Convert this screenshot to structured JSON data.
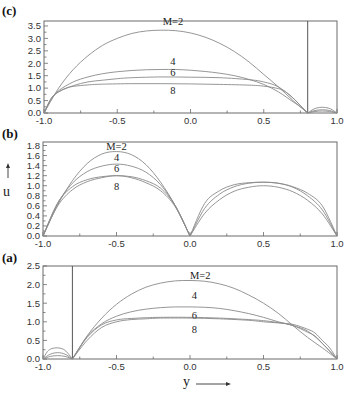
{
  "chart_data": [
    {
      "panel": "(c)",
      "type": "line",
      "xlim": [
        -1.0,
        1.0
      ],
      "ylim": [
        0,
        3.7
      ],
      "xticks": [
        -1.0,
        -0.5,
        0.0,
        0.5,
        1.0
      ],
      "xtick_labels": [
        "-1.0",
        "-0.5",
        "0.0",
        "0.5",
        "1.0"
      ],
      "yticks": [
        0.0,
        0.5,
        1.0,
        1.5,
        2.0,
        2.5,
        3.0,
        3.5
      ],
      "ytick_labels": [
        "0.0",
        "0.5",
        "1.0",
        "1.5",
        "2.0",
        "2.5",
        "3.0",
        "3.5"
      ],
      "vertical_line_at": 0.8,
      "frame": {
        "x0": 44,
        "x1": 337,
        "y0": 21,
        "y1": 113
      },
      "series": [
        {
          "name": "M=2",
          "label": "M=2",
          "label_pos": [
            -0.12,
            3.55
          ],
          "x": [
            -1.0,
            -0.9,
            -0.8,
            -0.7,
            -0.6,
            -0.5,
            -0.4,
            -0.3,
            -0.2,
            -0.1,
            0.0,
            0.1,
            0.2,
            0.3,
            0.4,
            0.5,
            0.6,
            0.7,
            0.8
          ],
          "y": [
            0.0,
            1.0,
            1.75,
            2.3,
            2.72,
            3.0,
            3.2,
            3.3,
            3.33,
            3.31,
            3.22,
            3.05,
            2.8,
            2.47,
            2.05,
            1.55,
            1.05,
            0.5,
            0.0
          ]
        },
        {
          "name": "M=4",
          "label": "4",
          "label_pos": [
            -0.12,
            1.95
          ],
          "x": [
            -1.0,
            -0.95,
            -0.9,
            -0.8,
            -0.7,
            -0.6,
            -0.5,
            -0.4,
            -0.3,
            -0.2,
            -0.1,
            0.0,
            0.1,
            0.2,
            0.3,
            0.4,
            0.5,
            0.6,
            0.7,
            0.75,
            0.8
          ],
          "y": [
            0.0,
            0.55,
            0.9,
            1.25,
            1.45,
            1.58,
            1.66,
            1.71,
            1.74,
            1.75,
            1.75,
            1.72,
            1.67,
            1.6,
            1.5,
            1.35,
            1.15,
            0.85,
            0.45,
            0.25,
            0.0
          ]
        },
        {
          "name": "M=6",
          "label": "6",
          "label_pos": [
            -0.12,
            1.5
          ],
          "x": [
            -1.0,
            -0.95,
            -0.9,
            -0.8,
            -0.7,
            -0.6,
            -0.5,
            -0.4,
            -0.2,
            0.0,
            0.2,
            0.4,
            0.5,
            0.6,
            0.7,
            0.75,
            0.8
          ],
          "y": [
            0.0,
            0.58,
            0.85,
            1.1,
            1.25,
            1.32,
            1.38,
            1.42,
            1.45,
            1.44,
            1.42,
            1.34,
            1.25,
            1.05,
            0.6,
            0.3,
            0.0
          ]
        },
        {
          "name": "M=8",
          "label": "8",
          "label_pos": [
            -0.12,
            0.75
          ],
          "x": [
            -1.0,
            -0.95,
            -0.9,
            -0.85,
            -0.8,
            -0.7,
            -0.6,
            -0.4,
            -0.2,
            0.0,
            0.2,
            0.4,
            0.5,
            0.6,
            0.65,
            0.7,
            0.75,
            0.8
          ],
          "y": [
            0.0,
            0.6,
            0.85,
            1.0,
            1.07,
            1.13,
            1.16,
            1.18,
            1.18,
            1.17,
            1.15,
            1.12,
            1.08,
            0.98,
            0.85,
            0.6,
            0.3,
            0.0
          ]
        },
        {
          "name": "M=2 (right)",
          "label": "",
          "x": [
            0.8,
            0.83,
            0.86,
            0.9,
            0.94,
            0.97,
            1.0
          ],
          "y": [
            0.0,
            0.12,
            0.2,
            0.23,
            0.2,
            0.12,
            0.0
          ]
        },
        {
          "name": "M=4 (right)",
          "label": "",
          "x": [
            0.8,
            0.85,
            0.9,
            0.95,
            1.0
          ],
          "y": [
            0.0,
            0.1,
            0.13,
            0.1,
            0.0
          ]
        },
        {
          "name": "M=6 (right)",
          "label": "",
          "x": [
            0.8,
            0.85,
            0.9,
            0.95,
            1.0
          ],
          "y": [
            0.0,
            0.06,
            0.08,
            0.06,
            0.0
          ]
        }
      ]
    },
    {
      "panel": "(b)",
      "type": "line",
      "xlim": [
        -1.0,
        1.0
      ],
      "ylim": [
        0,
        1.87
      ],
      "xticks": [
        -1.0,
        -0.5,
        0.0,
        0.5,
        1.0
      ],
      "xtick_labels": [
        "-1.0",
        "-0.5",
        "0.0",
        "0.5",
        "1.0"
      ],
      "yticks": [
        0.0,
        0.2,
        0.4,
        0.6,
        0.8,
        1.0,
        1.2,
        1.4,
        1.6,
        1.8
      ],
      "ytick_labels": [
        "0.0",
        "0.2",
        "0.4",
        "0.6",
        "0.8",
        "1.0",
        "1.2",
        "1.4",
        "1.6",
        "1.8"
      ],
      "ylabel": "u",
      "frame": {
        "x0": 43,
        "x1": 337,
        "y0": 142,
        "y1": 236
      },
      "series": [
        {
          "name": "M=2",
          "label": "M=2",
          "label_pos": [
            -0.5,
            1.72
          ],
          "x": [
            -1.0,
            -0.9,
            -0.8,
            -0.7,
            -0.6,
            -0.5,
            -0.4,
            -0.3,
            -0.2,
            -0.1,
            0.0
          ],
          "y": [
            0.0,
            0.62,
            1.1,
            1.44,
            1.63,
            1.68,
            1.62,
            1.42,
            1.07,
            0.6,
            0.0
          ]
        },
        {
          "name": "M=4",
          "label": "4",
          "label_pos": [
            -0.5,
            1.5
          ],
          "x": [
            -1.0,
            -0.9,
            -0.8,
            -0.7,
            -0.6,
            -0.5,
            -0.4,
            -0.3,
            -0.2,
            -0.1,
            0.0
          ],
          "y": [
            0.0,
            0.65,
            1.05,
            1.28,
            1.39,
            1.43,
            1.39,
            1.27,
            1.02,
            0.6,
            0.0
          ]
        },
        {
          "name": "M=6",
          "label": "6",
          "label_pos": [
            -0.5,
            1.28
          ],
          "x": [
            -1.0,
            -0.9,
            -0.8,
            -0.7,
            -0.6,
            -0.5,
            -0.4,
            -0.3,
            -0.2,
            -0.1,
            0.0
          ],
          "y": [
            0.0,
            0.66,
            0.98,
            1.12,
            1.18,
            1.2,
            1.18,
            1.1,
            0.95,
            0.6,
            0.0
          ]
        },
        {
          "name": "M=8",
          "label": "8",
          "label_pos": [
            -0.5,
            0.92
          ],
          "x": [
            -1.0,
            -0.9,
            -0.8,
            -0.7,
            -0.6,
            -0.5,
            -0.4,
            -0.3,
            -0.2,
            -0.1,
            0.0
          ],
          "y": [
            0.0,
            0.6,
            0.92,
            1.08,
            1.16,
            1.2,
            1.16,
            1.06,
            0.9,
            0.58,
            0.0
          ]
        },
        {
          "name": "M=2 (right)",
          "label": "",
          "x": [
            0.0,
            0.1,
            0.2,
            0.3,
            0.4,
            0.5,
            0.6,
            0.7,
            0.8,
            0.9,
            1.0
          ],
          "y": [
            0.0,
            0.65,
            0.9,
            1.02,
            1.06,
            1.07,
            1.05,
            0.98,
            0.85,
            0.6,
            0.0
          ]
        },
        {
          "name": "M=4 (right)",
          "label": "",
          "x": [
            0.0,
            0.1,
            0.2,
            0.3,
            0.4,
            0.5,
            0.6,
            0.7,
            0.8,
            0.9,
            1.0
          ],
          "y": [
            0.0,
            0.55,
            0.83,
            0.98,
            1.05,
            1.07,
            1.05,
            0.97,
            0.8,
            0.52,
            0.0
          ]
        },
        {
          "name": "M=8 (right)",
          "label": "",
          "x": [
            0.0,
            0.1,
            0.2,
            0.3,
            0.4,
            0.5,
            0.6,
            0.7,
            0.8,
            0.9,
            1.0
          ],
          "y": [
            0.0,
            0.45,
            0.72,
            0.89,
            0.97,
            1.0,
            0.97,
            0.88,
            0.71,
            0.44,
            0.0
          ]
        }
      ]
    },
    {
      "panel": "(a)",
      "type": "line",
      "xlim": [
        -1.0,
        1.0
      ],
      "ylim": [
        0,
        2.5
      ],
      "xticks": [
        -1.0,
        -0.5,
        0.0,
        0.5,
        1.0
      ],
      "xtick_labels": [
        "-1.0",
        "-0.5",
        "0.0",
        "0.5",
        "1.0"
      ],
      "yticks": [
        0.0,
        0.5,
        1.0,
        1.5,
        2.0,
        2.5
      ],
      "ytick_labels": [
        "0.0",
        "0.5",
        "1.0",
        "1.5",
        "2.0",
        "2.5"
      ],
      "xlabel": "y",
      "vertical_line_at": -0.8,
      "frame": {
        "x0": 43,
        "x1": 337,
        "y0": 266,
        "y1": 359
      },
      "series": [
        {
          "name": "M=2",
          "label": "M=2",
          "label_pos": [
            0.07,
            2.15
          ],
          "x": [
            -0.8,
            -0.7,
            -0.6,
            -0.5,
            -0.4,
            -0.3,
            -0.2,
            -0.1,
            0.0,
            0.1,
            0.2,
            0.3,
            0.4,
            0.5,
            0.6,
            0.7,
            0.8,
            0.9,
            1.0
          ],
          "y": [
            0.0,
            0.62,
            1.1,
            1.47,
            1.74,
            1.93,
            2.04,
            2.1,
            2.11,
            2.09,
            2.02,
            1.9,
            1.72,
            1.5,
            1.23,
            0.9,
            0.58,
            0.3,
            0.0
          ]
        },
        {
          "name": "M=4",
          "label": "4",
          "label_pos": [
            0.03,
            1.6
          ],
          "x": [
            -0.8,
            -0.7,
            -0.6,
            -0.5,
            -0.4,
            -0.3,
            -0.2,
            -0.1,
            0.0,
            0.1,
            0.2,
            0.3,
            0.4,
            0.5,
            0.6,
            0.7,
            0.8,
            0.9,
            1.0
          ],
          "y": [
            0.0,
            0.6,
            0.95,
            1.15,
            1.27,
            1.34,
            1.38,
            1.4,
            1.4,
            1.39,
            1.36,
            1.3,
            1.22,
            1.12,
            1.0,
            0.9,
            0.75,
            0.42,
            0.0
          ]
        },
        {
          "name": "M=6",
          "label": "6",
          "label_pos": [
            0.03,
            1.08
          ],
          "x": [
            -0.8,
            -0.7,
            -0.6,
            -0.5,
            -0.4,
            -0.3,
            -0.2,
            0.0,
            0.2,
            0.4,
            0.5,
            0.6,
            0.7,
            0.8,
            0.85,
            0.9,
            1.0
          ],
          "y": [
            0.0,
            0.58,
            0.92,
            1.05,
            1.09,
            1.11,
            1.12,
            1.12,
            1.1,
            1.06,
            1.03,
            0.98,
            0.9,
            0.72,
            0.62,
            0.42,
            0.0
          ]
        },
        {
          "name": "M=8",
          "label": "8",
          "label_pos": [
            0.03,
            0.7
          ],
          "x": [
            -0.8,
            -0.7,
            -0.6,
            -0.5,
            -0.4,
            -0.3,
            -0.2,
            0.0,
            0.2,
            0.4,
            0.5,
            0.6,
            0.7,
            0.8,
            0.85,
            0.9,
            0.95,
            1.0
          ],
          "y": [
            0.0,
            0.5,
            0.85,
            1.0,
            1.06,
            1.08,
            1.1,
            1.1,
            1.08,
            1.04,
            1.0,
            0.97,
            0.93,
            0.8,
            0.7,
            0.5,
            0.3,
            0.0
          ]
        },
        {
          "name": "M=2 (left)",
          "label": "",
          "x": [
            -1.0,
            -0.97,
            -0.94,
            -0.9,
            -0.86,
            -0.83,
            -0.8
          ],
          "y": [
            0.0,
            0.2,
            0.28,
            0.3,
            0.26,
            0.15,
            0.0
          ]
        },
        {
          "name": "M=4 (left)",
          "label": "",
          "x": [
            -1.0,
            -0.95,
            -0.9,
            -0.85,
            -0.8
          ],
          "y": [
            0.0,
            0.13,
            0.17,
            0.13,
            0.0
          ]
        },
        {
          "name": "M=6 (left)",
          "label": "",
          "x": [
            -1.0,
            -0.95,
            -0.9,
            -0.85,
            -0.8
          ],
          "y": [
            0.0,
            0.07,
            0.09,
            0.07,
            0.0
          ]
        }
      ]
    }
  ],
  "labels": {
    "panel_c": "(c)",
    "panel_b": "(b)",
    "panel_a": "(a)",
    "ylabel": "u",
    "xlabel": "y"
  }
}
